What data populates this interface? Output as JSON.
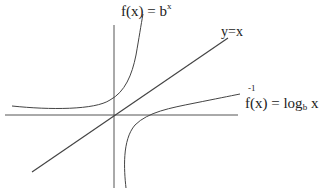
{
  "diagram": {
    "labels": {
      "exp": {
        "prefix": "f(x) = b",
        "superscript": "x"
      },
      "identity": "y=x",
      "log": {
        "inverse_mark": "-1",
        "prefix": "f(x) = log",
        "subscript": "b",
        "suffix": " x"
      }
    },
    "stroke_color": "#444444",
    "elements": [
      "x-axis",
      "y-axis",
      "identity-line",
      "exponential-curve",
      "logarithm-curve"
    ]
  }
}
